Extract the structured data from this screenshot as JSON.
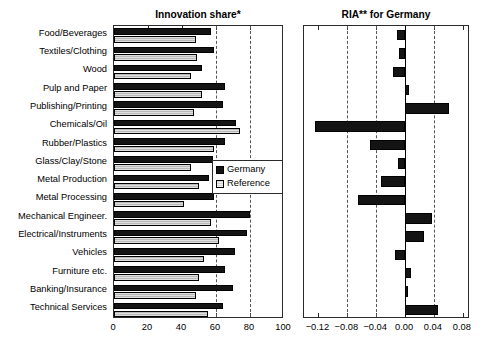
{
  "figure": {
    "left_panel_title": "Innovation share*",
    "right_panel_title": "RIA** for Germany"
  },
  "legend": {
    "items": [
      {
        "label": "Germany",
        "swatch": "black-square-icon",
        "color": "#141414"
      },
      {
        "label": "Reference",
        "swatch": "gray-hatched-square-icon",
        "color": "#b9b9b9"
      }
    ]
  },
  "categories": [
    "Food/Beverages",
    "Textiles/Clothing",
    "Wood",
    "Pulp and Paper",
    "Publishing/Printing",
    "Chemicals/Oil",
    "Rubber/Plastics",
    "Glass/Clay/Stone",
    "Metal Production",
    "Metal Processing",
    "Mechanical Engineer.",
    "Electrical/Instruments",
    "Vehicles",
    "Furniture etc.",
    "Banking/Insurance",
    "Technical Services"
  ],
  "axes": {
    "left": {
      "ticks": [
        0,
        20,
        40,
        60,
        80,
        100
      ],
      "tick_labels": [
        "0",
        "20",
        "40",
        "60",
        "80",
        "100"
      ],
      "min": 0,
      "max": 100,
      "gridlines": [
        60,
        80
      ]
    },
    "right": {
      "ticks": [
        -0.12,
        -0.08,
        -0.04,
        0.0,
        0.04,
        0.08
      ],
      "tick_labels": [
        "−0.12",
        "−0.08",
        "−0.04",
        "0.00",
        "0.04",
        "0.08"
      ],
      "min": -0.14,
      "max": 0.09,
      "gridlines": [
        -0.08,
        -0.04,
        0.04
      ],
      "zero": 0.0
    }
  },
  "chart_data": [
    {
      "type": "bar",
      "orientation": "horizontal",
      "title": "Innovation share*",
      "xlabel": "",
      "ylabel": "",
      "xlim": [
        0,
        100
      ],
      "grid": true,
      "legend_position": "inside-right-middle",
      "categories": [
        "Food/Beverages",
        "Textiles/Clothing",
        "Wood",
        "Pulp and Paper",
        "Publishing/Printing",
        "Chemicals/Oil",
        "Rubber/Plastics",
        "Glass/Clay/Stone",
        "Metal Production",
        "Metal Processing",
        "Mechanical Engineer.",
        "Electrical/Instruments",
        "Vehicles",
        "Furniture etc.",
        "Banking/Insurance",
        "Technical Services"
      ],
      "series": [
        {
          "name": "Germany",
          "color": "#141414",
          "values": [
            57,
            59,
            52,
            65,
            64,
            72,
            65,
            58,
            56,
            59,
            80,
            78,
            71,
            65,
            70,
            64
          ]
        },
        {
          "name": "Reference",
          "color": "#b9b9b9",
          "values": [
            48,
            49,
            45,
            52,
            47,
            74,
            59,
            45,
            50,
            41,
            57,
            62,
            53,
            50,
            48,
            55
          ]
        }
      ]
    },
    {
      "type": "bar",
      "orientation": "horizontal",
      "title": "RIA** for Germany",
      "xlabel": "",
      "ylabel": "",
      "xlim": [
        -0.14,
        0.09
      ],
      "grid": true,
      "categories": [
        "Food/Beverages",
        "Textiles/Clothing",
        "Wood",
        "Pulp and Paper",
        "Publishing/Printing",
        "Chemicals/Oil",
        "Rubber/Plastics",
        "Glass/Clay/Stone",
        "Metal Production",
        "Metal Processing",
        "Mechanical Engineer.",
        "Electrical/Instruments",
        "Vehicles",
        "Furniture etc.",
        "Banking/Insurance",
        "Technical Services"
      ],
      "series": [
        {
          "name": "RIA for Germany",
          "color": "#141414",
          "values": [
            -0.011,
            -0.009,
            -0.016,
            0.006,
            0.061,
            -0.125,
            -0.049,
            -0.01,
            -0.034,
            -0.065,
            0.037,
            0.026,
            -0.014,
            0.008,
            0.004,
            0.046,
            -0.037
          ]
        }
      ]
    }
  ]
}
